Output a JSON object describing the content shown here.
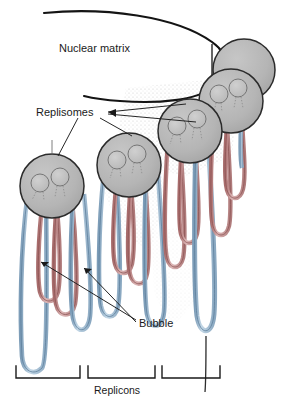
{
  "figure": {
    "background_color": "#ffffff",
    "width": 282,
    "height": 406
  },
  "labels": {
    "nuclear_matrix": "Nuclear matrix",
    "replisomes": "Replisomes",
    "bubble": "Bubble",
    "replicons": "Replicons"
  },
  "colors": {
    "strand_blue": "#6a8fae",
    "strand_blue_fill": "#a9c4da",
    "strand_red": "#8d4a4a",
    "strand_red_fill": "#c99a9a",
    "replisome_fill": "#b8b8b8",
    "replisome_stroke": "#2b2b2b",
    "subunit_fill": "#c4c4c4",
    "outline": "#1a1a1a",
    "stipple": "#c9c9c9"
  },
  "replisomes": [
    {
      "id": "replisome-1",
      "cx": 52,
      "cy": 186,
      "r": 32,
      "subunits": 2,
      "labeled": true
    },
    {
      "id": "replisome-2",
      "cx": 129,
      "cy": 165,
      "r": 32,
      "subunits": 2,
      "labeled": true
    },
    {
      "id": "replisome-3",
      "cx": 190,
      "cy": 131,
      "r": 32,
      "subunits": 2,
      "labeled": true
    },
    {
      "id": "replisome-4",
      "cx": 231,
      "cy": 101,
      "r": 32,
      "subunits": 2,
      "labeled": true
    },
    {
      "id": "replisome-5",
      "cx": 244,
      "cy": 70,
      "r": 31,
      "subunits": 0,
      "labeled": false
    }
  ],
  "replicon_brackets": [
    {
      "id": "replicon-bracket-1",
      "x1": 16,
      "x2": 80
    },
    {
      "id": "replicon-bracket-2",
      "x1": 88,
      "x2": 155
    },
    {
      "id": "replicon-bracket-3",
      "x1": 162,
      "x2": 220
    }
  ],
  "leader_lines": {
    "replisomes_to_targets": 4,
    "bubble_arrows": 2
  }
}
